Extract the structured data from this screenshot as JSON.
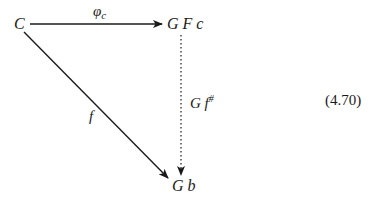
{
  "diagram": {
    "nodes": {
      "source": {
        "label": "C"
      },
      "top_right": {
        "label": "G F c"
      },
      "bottom": {
        "label": "G b"
      }
    },
    "arrows": {
      "top": {
        "label_main": "φ",
        "label_sub": "c",
        "style": "solid"
      },
      "diagonal": {
        "label": "f",
        "style": "solid"
      },
      "vertical": {
        "label_main": "G f",
        "label_sup": "#",
        "style": "dotted"
      }
    },
    "equation_number": "(4.70)"
  }
}
